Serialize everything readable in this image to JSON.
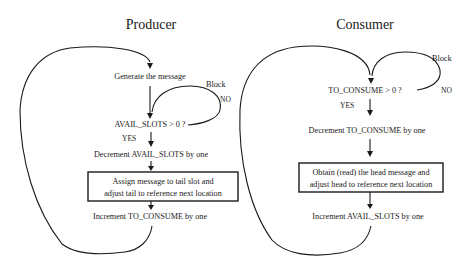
{
  "producer": {
    "title": "Producer",
    "steps": {
      "generate": "Generate the message",
      "check": "AVAIL_SLOTS > 0 ?",
      "yes": "YES",
      "no": "NO",
      "block": "Block",
      "decrement": "Decrement AVAIL_SLOTS by one",
      "assign_line1": "Assign message to tail slot and",
      "assign_line2": "adjust tail to reference next location",
      "increment": "Increment TO_CONSUME by one"
    }
  },
  "consumer": {
    "title": "Consumer",
    "steps": {
      "check": "TO_CONSUME > 0 ?",
      "yes": "YES",
      "no": "NO",
      "block": "Block",
      "decrement": "Decrement TO_CONSUME by one",
      "obtain_line1": "Obtain (read) the head message and",
      "obtain_line2": "adjust head to reference next location",
      "increment": "Increment AVAIL_SLOTS by one"
    }
  },
  "colors": {
    "ink": "#1a1a1a",
    "background": "#ffffff"
  }
}
